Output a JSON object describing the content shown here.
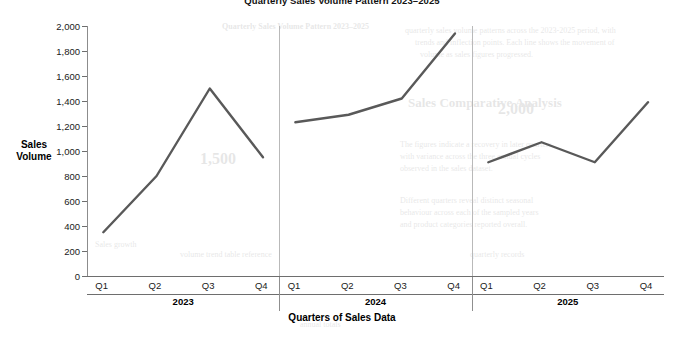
{
  "chart_data": {
    "type": "line",
    "title": "Quarterly Sales Volume Pattern 2023–2025",
    "xlabel": "Quarters of Sales Data",
    "ylabel": "Sales Volume",
    "ylim": [
      0,
      2000
    ],
    "ytick_step": 200,
    "ytick_labels": [
      "2,000",
      "1,800",
      "1,600",
      "1,400",
      "1,200",
      "1,000",
      "800",
      "600",
      "400",
      "200",
      "0"
    ],
    "ytick_values": [
      2000,
      1800,
      1600,
      1400,
      1200,
      1000,
      800,
      600,
      400,
      200,
      0
    ],
    "grid": false,
    "legend": null,
    "categories": [
      "Q1",
      "Q2",
      "Q3",
      "Q4"
    ],
    "panel_groups": [
      "2023",
      "2024",
      "2025"
    ],
    "line_color": "#595959",
    "line_width": 2.4,
    "series": [
      {
        "name": "2023",
        "categories": [
          "Q1",
          "Q2",
          "Q3",
          "Q4"
        ],
        "values": [
          350,
          800,
          1500,
          950
        ]
      },
      {
        "name": "2024",
        "categories": [
          "Q1",
          "Q2",
          "Q3",
          "Q4"
        ],
        "values": [
          1230,
          1290,
          1420,
          1940
        ]
      },
      {
        "name": "2025",
        "categories": [
          "Q1",
          "Q2",
          "Q3",
          "Q4"
        ],
        "values": [
          910,
          1070,
          910,
          1390
        ]
      }
    ]
  },
  "axis": {
    "y_title_line1": "Sales",
    "y_title_line2": "Volume"
  },
  "bleed_text": [
    {
      "text": "Quarterly Sales Volume Pattern 2023–2025",
      "x": 222,
      "y": 22,
      "size": 8,
      "bold": true
    },
    {
      "text": "quarterly sales volume patterns across the 2023-2025 period, with",
      "x": 405,
      "y": 26,
      "size": 8
    },
    {
      "text": "trends and inflection points. Each line shows the movement of",
      "x": 415,
      "y": 38,
      "size": 8
    },
    {
      "text": "volume as sales figures progressed.",
      "x": 420,
      "y": 50,
      "size": 8
    },
    {
      "text": "Sales Comparative Analysis",
      "x": 408,
      "y": 95,
      "size": 13,
      "bold": true
    },
    {
      "text": "The figures indicate a recovery in later quarters",
      "x": 400,
      "y": 140,
      "size": 8
    },
    {
      "text": "with variance across the three annual cycles",
      "x": 400,
      "y": 152,
      "size": 8
    },
    {
      "text": "observed in the sales dataset.",
      "x": 400,
      "y": 164,
      "size": 8
    },
    {
      "text": "Different quarters reveal distinct seasonal",
      "x": 400,
      "y": 196,
      "size": 8
    },
    {
      "text": "behaviour across each of the sampled years",
      "x": 400,
      "y": 208,
      "size": 8
    },
    {
      "text": "and product categories reported overall.",
      "x": 400,
      "y": 220,
      "size": 8
    },
    {
      "text": "1,500",
      "x": 200,
      "y": 150,
      "size": 16,
      "bold": true
    },
    {
      "text": "2,000",
      "x": 498,
      "y": 100,
      "size": 16,
      "bold": true
    },
    {
      "text": "Sales growth",
      "x": 95,
      "y": 240,
      "size": 8
    },
    {
      "text": "volume trend table reference",
      "x": 180,
      "y": 250,
      "size": 8
    },
    {
      "text": "quarterly records",
      "x": 470,
      "y": 250,
      "size": 8
    },
    {
      "text": "annual totals",
      "x": 300,
      "y": 320,
      "size": 8
    }
  ]
}
